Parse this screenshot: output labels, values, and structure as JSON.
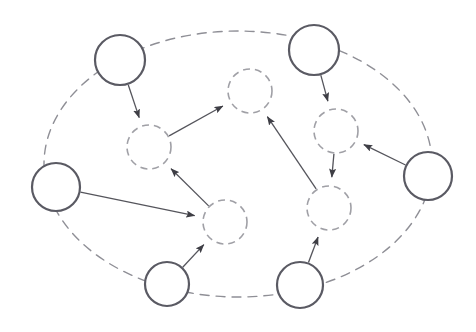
{
  "canvas": {
    "width": 476,
    "height": 332,
    "background": "#ffffff",
    "title": "Directed graph of observed and latent nodes inside a dashed boundary"
  },
  "style": {
    "solid_node_stroke": "#5a5a63",
    "solid_node_stroke_width": 2.2,
    "solid_node_fill": "#ffffff",
    "dashed_node_stroke": "#a0a0a6",
    "dashed_node_stroke_width": 1.6,
    "dashed_node_fill": "#ffffff",
    "dashed_node_dash": "7 5",
    "boundary_stroke": "#8f8f96",
    "boundary_stroke_width": 1.4,
    "boundary_dash": "9 7",
    "edge_stroke": "#55555c",
    "edge_stroke_width": 1.3,
    "arrowhead_fill": "#3e3e45"
  },
  "boundary": {
    "name": "plate-boundary",
    "shape": "ellipse",
    "cx": 238,
    "cy": 164,
    "rx": 194,
    "ry": 133,
    "label": ""
  },
  "nodes": [
    {
      "id": "s1",
      "kind": "solid",
      "cx": 120,
      "cy": 60,
      "r": 25,
      "label": ""
    },
    {
      "id": "s2",
      "kind": "solid",
      "cx": 314,
      "cy": 50,
      "r": 25,
      "label": ""
    },
    {
      "id": "s3",
      "kind": "solid",
      "cx": 56,
      "cy": 187,
      "r": 24,
      "label": ""
    },
    {
      "id": "s4",
      "kind": "solid",
      "cx": 428,
      "cy": 176,
      "r": 24,
      "label": ""
    },
    {
      "id": "s5",
      "kind": "solid",
      "cx": 167,
      "cy": 284,
      "r": 22,
      "label": ""
    },
    {
      "id": "s6",
      "kind": "solid",
      "cx": 300,
      "cy": 285,
      "r": 23,
      "label": ""
    },
    {
      "id": "d1",
      "kind": "dashed",
      "cx": 149,
      "cy": 147,
      "r": 22,
      "label": ""
    },
    {
      "id": "d2",
      "kind": "dashed",
      "cx": 250,
      "cy": 91,
      "r": 22,
      "label": ""
    },
    {
      "id": "d3",
      "kind": "dashed",
      "cx": 225,
      "cy": 222,
      "r": 22,
      "label": ""
    },
    {
      "id": "d4",
      "kind": "dashed",
      "cx": 336,
      "cy": 131,
      "r": 22,
      "label": ""
    },
    {
      "id": "d5",
      "kind": "dashed",
      "cx": 329,
      "cy": 208,
      "r": 22,
      "label": ""
    }
  ],
  "edges": [
    {
      "id": "e1",
      "from": "s1",
      "to": "d1",
      "directed": true
    },
    {
      "id": "e2",
      "from": "d1",
      "to": "d2",
      "directed": true
    },
    {
      "id": "e3",
      "from": "d3",
      "to": "d1",
      "directed": true
    },
    {
      "id": "e4",
      "from": "s3",
      "to": "d3",
      "directed": true
    },
    {
      "id": "e5",
      "from": "s5",
      "to": "d3",
      "directed": true
    },
    {
      "id": "e6",
      "from": "s2",
      "to": "d4",
      "directed": true
    },
    {
      "id": "e7",
      "from": "s4",
      "to": "d4",
      "directed": true
    },
    {
      "id": "e8",
      "from": "d4",
      "to": "d5",
      "directed": true
    },
    {
      "id": "e9",
      "from": "s6",
      "to": "d5",
      "directed": true
    },
    {
      "id": "e10",
      "from": "d5",
      "to": "d2",
      "directed": true
    }
  ],
  "legend": {
    "items": []
  },
  "annotations": []
}
